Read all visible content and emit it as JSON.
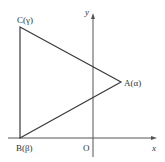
{
  "diagram": {
    "type": "triangle-on-coordinate-plane",
    "colors": {
      "line": "#3a3a3a",
      "axis": "#555555",
      "text": "#333333",
      "background": "#ffffff"
    },
    "axes": {
      "x_label": "x",
      "y_label": "y",
      "origin_label": "O"
    },
    "vertices": [
      {
        "id": "A",
        "label": "A(α)"
      },
      {
        "id": "B",
        "label": "B(β)"
      },
      {
        "id": "C",
        "label": "C(γ)"
      }
    ]
  }
}
